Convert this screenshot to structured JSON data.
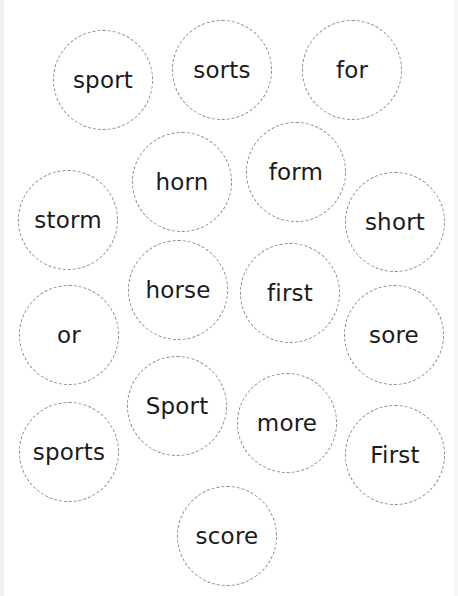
{
  "worksheet": {
    "bubbles": [
      {
        "word": "sport",
        "cx": 103,
        "cy": 80
      },
      {
        "word": "sorts",
        "cx": 222,
        "cy": 70
      },
      {
        "word": "for",
        "cx": 352,
        "cy": 70
      },
      {
        "word": "horn",
        "cx": 182,
        "cy": 182
      },
      {
        "word": "form",
        "cx": 296,
        "cy": 172
      },
      {
        "word": "storm",
        "cx": 68,
        "cy": 220
      },
      {
        "word": "short",
        "cx": 395,
        "cy": 222
      },
      {
        "word": "horse",
        "cx": 178,
        "cy": 290
      },
      {
        "word": "first",
        "cx": 290,
        "cy": 293
      },
      {
        "word": "or",
        "cx": 69,
        "cy": 335
      },
      {
        "word": "sore",
        "cx": 394,
        "cy": 335
      },
      {
        "word": "Sport",
        "cx": 177,
        "cy": 406
      },
      {
        "word": "more",
        "cx": 287,
        "cy": 423
      },
      {
        "word": "sports",
        "cx": 69,
        "cy": 452
      },
      {
        "word": "First",
        "cx": 395,
        "cy": 455
      },
      {
        "word": "score",
        "cx": 227,
        "cy": 536
      }
    ],
    "colors": {
      "background": "#ffffff",
      "circle_border": "#8a8a8a",
      "text": "#1a1a1a"
    }
  }
}
